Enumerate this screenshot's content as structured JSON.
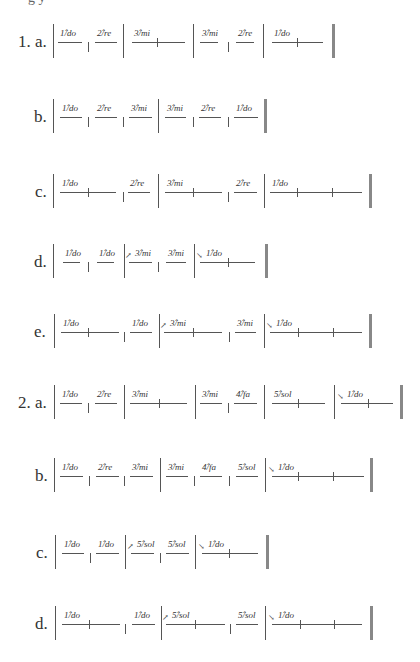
{
  "page": {
    "cut_text": "g      y"
  },
  "exercises": [
    {
      "label": "1. a.",
      "label_x": 18,
      "y": 42,
      "bars": [
        53,
        123,
        193,
        263
      ],
      "short_bars": [
        88,
        228
      ],
      "double_bar": 332,
      "cells": [
        {
          "text": "1̂/do",
          "x1": 58,
          "x2": 82,
          "ticks": [],
          "arrow": ""
        },
        {
          "text": "2̂/re",
          "x1": 95,
          "x2": 117,
          "ticks": [],
          "arrow": ""
        },
        {
          "text": "3̂/mi",
          "x1": 132,
          "x2": 185,
          "ticks": [
            157
          ],
          "arrow": ""
        },
        {
          "text": "3̂/mi",
          "x1": 200,
          "x2": 218,
          "ticks": [],
          "arrow": ""
        },
        {
          "text": "2̂/re",
          "x1": 236,
          "x2": 254,
          "ticks": [],
          "arrow": ""
        },
        {
          "text": "1̂/do",
          "x1": 272,
          "x2": 323,
          "ticks": [
            297
          ],
          "arrow": ""
        }
      ]
    },
    {
      "label": "b.",
      "label_x": 34,
      "y": 117,
      "bars": [
        53,
        158
      ],
      "short_bars": [
        88,
        123,
        193,
        228
      ],
      "double_bar": 264,
      "cells": [
        {
          "text": "1̂/do",
          "x1": 60,
          "x2": 82,
          "ticks": [],
          "arrow": ""
        },
        {
          "text": "2̂/re",
          "x1": 95,
          "x2": 117,
          "ticks": [],
          "arrow": ""
        },
        {
          "text": "3̂/mi",
          "x1": 129,
          "x2": 152,
          "ticks": [],
          "arrow": ""
        },
        {
          "text": "3̂/mi",
          "x1": 165,
          "x2": 186,
          "ticks": [],
          "arrow": ""
        },
        {
          "text": "2̂/re",
          "x1": 199,
          "x2": 221,
          "ticks": [],
          "arrow": ""
        },
        {
          "text": "1̂/do",
          "x1": 234,
          "x2": 258,
          "ticks": [],
          "arrow": ""
        }
      ]
    },
    {
      "label": "c.",
      "label_x": 35,
      "y": 192,
      "bars": [
        53,
        158,
        264
      ],
      "short_bars": [
        123,
        228
      ],
      "double_bar": 369,
      "cells": [
        {
          "text": "1̂/do",
          "x1": 60,
          "x2": 116,
          "ticks": [
            88
          ],
          "arrow": ""
        },
        {
          "text": "2̂/re",
          "x1": 128,
          "x2": 150,
          "ticks": [],
          "arrow": ""
        },
        {
          "text": "3̂/mi",
          "x1": 165,
          "x2": 222,
          "ticks": [
            193
          ],
          "arrow": ""
        },
        {
          "text": "2̂/re",
          "x1": 234,
          "x2": 257,
          "ticks": [],
          "arrow": ""
        },
        {
          "text": "1̂/do",
          "x1": 270,
          "x2": 362,
          "ticks": [
            297,
            332
          ],
          "arrow": ""
        }
      ]
    },
    {
      "label": "d.",
      "label_x": 34,
      "y": 262,
      "bars": [
        53,
        124,
        194
      ],
      "short_bars": [
        88,
        158
      ],
      "double_bar": 265,
      "cells": [
        {
          "text": "1̂/do",
          "x1": 63,
          "x2": 80,
          "ticks": [],
          "arrow": ""
        },
        {
          "text": "1̂/do",
          "x1": 97,
          "x2": 114,
          "ticks": [],
          "arrow": ""
        },
        {
          "text": "3̂/mi",
          "x1": 129,
          "x2": 152,
          "ticks": [],
          "arrow": "↗"
        },
        {
          "text": "3̂/mi",
          "x1": 166,
          "x2": 186,
          "ticks": [],
          "arrow": ""
        },
        {
          "text": "1̂/do",
          "x1": 200,
          "x2": 255,
          "ticks": [
            228
          ],
          "arrow": "↘"
        }
      ]
    },
    {
      "label": "e.",
      "label_x": 34,
      "y": 332,
      "bars": [
        54,
        159,
        264
      ],
      "short_bars": [
        124,
        229
      ],
      "double_bar": 369,
      "cells": [
        {
          "text": "1̂/do",
          "x1": 61,
          "x2": 119,
          "ticks": [
            88
          ],
          "arrow": ""
        },
        {
          "text": "1̂/do",
          "x1": 130,
          "x2": 152,
          "ticks": [],
          "arrow": ""
        },
        {
          "text": "3̂/mi",
          "x1": 164,
          "x2": 222,
          "ticks": [
            193
          ],
          "arrow": "↗"
        },
        {
          "text": "3̂/mi",
          "x1": 235,
          "x2": 256,
          "ticks": [],
          "arrow": ""
        },
        {
          "text": "1̂/do",
          "x1": 270,
          "x2": 362,
          "ticks": [
            298,
            333
          ],
          "arrow": "↘"
        }
      ]
    },
    {
      "label": "2. a.",
      "label_x": 18,
      "y": 403,
      "bars": [
        54,
        124,
        195,
        264,
        334
      ],
      "short_bars": [
        88,
        228
      ],
      "double_bar": 400,
      "cells": [
        {
          "text": "1̂/do",
          "x1": 60,
          "x2": 82,
          "ticks": [],
          "arrow": ""
        },
        {
          "text": "2̂/re",
          "x1": 95,
          "x2": 117,
          "ticks": [],
          "arrow": ""
        },
        {
          "text": "3̂/mi",
          "x1": 130,
          "x2": 187,
          "ticks": [
            159
          ],
          "arrow": ""
        },
        {
          "text": "3̂/mi",
          "x1": 200,
          "x2": 222,
          "ticks": [],
          "arrow": ""
        },
        {
          "text": "4̂/fa",
          "x1": 234,
          "x2": 257,
          "ticks": [],
          "arrow": ""
        },
        {
          "text": "5̂/sol",
          "x1": 272,
          "x2": 325,
          "ticks": [
            298
          ],
          "arrow": ""
        },
        {
          "text": "1̂/do",
          "x1": 341,
          "x2": 393,
          "ticks": [
            368
          ],
          "arrow": "↘"
        }
      ]
    },
    {
      "label": "b.",
      "label_x": 35,
      "y": 476,
      "bars": [
        54,
        160,
        265
      ],
      "short_bars": [
        89,
        124,
        194,
        229
      ],
      "double_bar": 370,
      "cells": [
        {
          "text": "1̂/do",
          "x1": 60,
          "x2": 83,
          "ticks": [],
          "arrow": ""
        },
        {
          "text": "2̂/re",
          "x1": 96,
          "x2": 119,
          "ticks": [],
          "arrow": ""
        },
        {
          "text": "3̂/mi",
          "x1": 130,
          "x2": 153,
          "ticks": [],
          "arrow": ""
        },
        {
          "text": "3̂/mi",
          "x1": 166,
          "x2": 188,
          "ticks": [],
          "arrow": ""
        },
        {
          "text": "4̂/fa",
          "x1": 200,
          "x2": 222,
          "ticks": [],
          "arrow": ""
        },
        {
          "text": "5̂/sol",
          "x1": 236,
          "x2": 258,
          "ticks": [],
          "arrow": ""
        },
        {
          "text": "1̂/do",
          "x1": 272,
          "x2": 364,
          "ticks": [
            298,
            333
          ],
          "arrow": "↘"
        }
      ]
    },
    {
      "label": "c.",
      "label_x": 36,
      "y": 553,
      "bars": [
        55,
        125,
        195
      ],
      "short_bars": [
        90,
        160
      ],
      "double_bar": 266,
      "cells": [
        {
          "text": "1̂/do",
          "x1": 62,
          "x2": 84,
          "ticks": [],
          "arrow": ""
        },
        {
          "text": "1̂/do",
          "x1": 96,
          "x2": 119,
          "ticks": [],
          "arrow": ""
        },
        {
          "text": "5̂/sol",
          "x1": 131,
          "x2": 154,
          "ticks": [],
          "arrow": "↗"
        },
        {
          "text": "5̂/sol",
          "x1": 166,
          "x2": 189,
          "ticks": [],
          "arrow": ""
        },
        {
          "text": "1̂/do",
          "x1": 202,
          "x2": 258,
          "ticks": [
            229
          ],
          "arrow": "↘"
        }
      ]
    },
    {
      "label": "d.",
      "label_x": 35,
      "y": 624,
      "bars": [
        55,
        161,
        265
      ],
      "short_bars": [
        125,
        230
      ],
      "double_bar": 370,
      "cells": [
        {
          "text": "1̂/do",
          "x1": 62,
          "x2": 120,
          "ticks": [
            89
          ],
          "arrow": ""
        },
        {
          "text": "1̂/do",
          "x1": 132,
          "x2": 155,
          "ticks": [],
          "arrow": ""
        },
        {
          "text": "5̂/sol",
          "x1": 166,
          "x2": 225,
          "ticks": [
            195
          ],
          "arrow": "↗"
        },
        {
          "text": "5̂/sol",
          "x1": 236,
          "x2": 258,
          "ticks": [],
          "arrow": ""
        },
        {
          "text": "1̂/do",
          "x1": 272,
          "x2": 362,
          "ticks": [
            300,
            334
          ],
          "arrow": "↘"
        }
      ]
    }
  ]
}
